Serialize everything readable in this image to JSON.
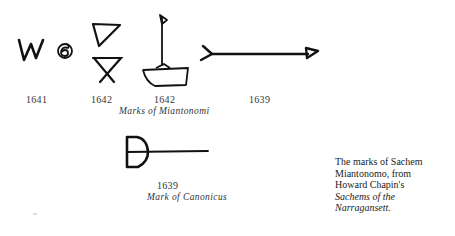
{
  "figure": {
    "miantonomi_marks": [
      {
        "symbol": "W-and-spiral",
        "year": "1641"
      },
      {
        "symbol": "triangle-and-hourglass",
        "year": "1642"
      },
      {
        "symbol": "boat-with-flag",
        "year": "1642"
      },
      {
        "symbol": "arrow",
        "year": "1639"
      }
    ],
    "miantonomi_caption": "Marks of Miantonomi",
    "canonicus_mark": {
      "symbol": "D-with-line",
      "year": "1639"
    },
    "canonicus_caption": "Mark of Canonicus"
  },
  "sidebar_caption": {
    "line1": "The marks of Sachem",
    "line2": "Miantonomo, from",
    "line3": "Howard Chapin's",
    "line4": "Sachems of the",
    "line5": "Narragansett."
  }
}
